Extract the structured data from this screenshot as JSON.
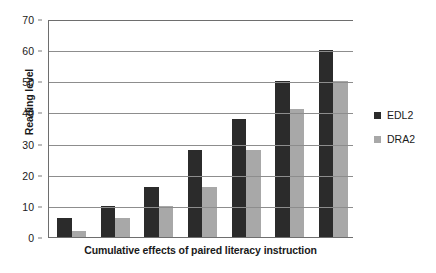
{
  "chart_data": {
    "type": "bar",
    "title": "",
    "subtitle": "",
    "xlabel": "Cumulative effects of paired literacy instruction",
    "ylabel": "Reading level",
    "categories": [
      "1",
      "2",
      "3",
      "4",
      "5",
      "6",
      "7"
    ],
    "series": [
      {
        "name": "EDL2",
        "color": "#2b2b2b",
        "values": [
          6,
          10,
          16,
          28,
          38,
          50,
          60
        ]
      },
      {
        "name": "DRA2",
        "color": "#a8a8a8",
        "values": [
          2,
          6,
          10,
          16,
          28,
          41,
          50
        ]
      }
    ],
    "ylim": [
      0,
      70
    ],
    "ytick_step": 10,
    "yticks": [
      "0",
      "10",
      "20",
      "30",
      "40",
      "50",
      "60",
      "70"
    ],
    "xticks_visible": false,
    "grid": true,
    "grid_axis": "y",
    "legend_position": "right",
    "annotations": []
  },
  "legend": {
    "items": [
      {
        "label": "EDL2",
        "swatch": "legend-swatch-edl2"
      },
      {
        "label": "DRA2",
        "swatch": "legend-swatch-dra2"
      }
    ]
  }
}
